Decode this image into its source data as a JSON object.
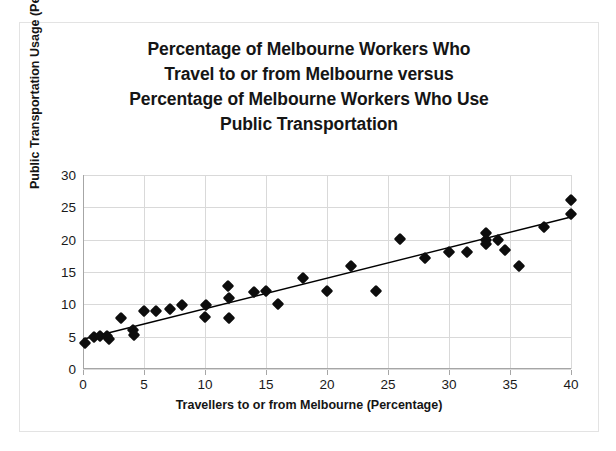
{
  "chart_data": {
    "type": "scatter",
    "title": "Percentage of Melbourne Workers Who Travel to or from Melbourne versus Percentage of Melbourne Workers Who Use Public Transportation",
    "title_lines": [
      "Percentage of Melbourne Workers Who",
      "Travel to or from Melbourne versus",
      "Percentage of Melbourne Workers Who Use",
      "Public Transportation"
    ],
    "xlabel": "Travellers to or from Melbourne (Percentage)",
    "ylabel": "Public Transportation Usage (Percentae)",
    "xlim": [
      0,
      40
    ],
    "ylim": [
      0,
      30
    ],
    "xticks": [
      0,
      5,
      10,
      15,
      20,
      25,
      30,
      35,
      40
    ],
    "yticks": [
      0,
      5,
      10,
      15,
      20,
      25,
      30
    ],
    "xtick_labels": [
      "0",
      "5",
      "10",
      "15",
      "20",
      "25",
      "30",
      "35",
      "40"
    ],
    "ytick_labels": [
      "0",
      "5",
      "10",
      "15",
      "20",
      "25",
      "30"
    ],
    "grid": true,
    "legend": false,
    "marker": "diamond",
    "marker_color": "#0d0d0d",
    "trendline": {
      "visible": true,
      "color": "#000000",
      "x_start": 0,
      "y_start": 4.6,
      "x_end": 40,
      "y_end": 23.5
    },
    "points": [
      {
        "x": 0.2,
        "y": 4.0
      },
      {
        "x": 0.9,
        "y": 5.0
      },
      {
        "x": 1.4,
        "y": 5.1
      },
      {
        "x": 2.0,
        "y": 5.1
      },
      {
        "x": 2.1,
        "y": 4.6
      },
      {
        "x": 3.1,
        "y": 7.9
      },
      {
        "x": 4.1,
        "y": 6.0
      },
      {
        "x": 4.2,
        "y": 5.2
      },
      {
        "x": 5.0,
        "y": 8.9
      },
      {
        "x": 6.0,
        "y": 8.9
      },
      {
        "x": 7.1,
        "y": 9.3
      },
      {
        "x": 8.1,
        "y": 9.9
      },
      {
        "x": 10.1,
        "y": 9.9
      },
      {
        "x": 10.0,
        "y": 8.1
      },
      {
        "x": 11.9,
        "y": 12.9
      },
      {
        "x": 12.0,
        "y": 11.0
      },
      {
        "x": 12.0,
        "y": 7.9
      },
      {
        "x": 14.0,
        "y": 11.9
      },
      {
        "x": 15.0,
        "y": 12.0
      },
      {
        "x": 16.0,
        "y": 10.0
      },
      {
        "x": 18.0,
        "y": 14.0
      },
      {
        "x": 20.0,
        "y": 12.0
      },
      {
        "x": 22.0,
        "y": 16.0
      },
      {
        "x": 24.0,
        "y": 12.0
      },
      {
        "x": 26.0,
        "y": 20.1
      },
      {
        "x": 28.0,
        "y": 17.1
      },
      {
        "x": 30.0,
        "y": 18.1
      },
      {
        "x": 31.5,
        "y": 18.1
      },
      {
        "x": 33.0,
        "y": 21.0
      },
      {
        "x": 33.0,
        "y": 19.9
      },
      {
        "x": 33.0,
        "y": 19.3
      },
      {
        "x": 34.0,
        "y": 19.9
      },
      {
        "x": 34.6,
        "y": 18.4
      },
      {
        "x": 35.7,
        "y": 16.0
      },
      {
        "x": 37.8,
        "y": 22.0
      },
      {
        "x": 40.0,
        "y": 26.1
      },
      {
        "x": 40.0,
        "y": 24.0
      }
    ]
  }
}
